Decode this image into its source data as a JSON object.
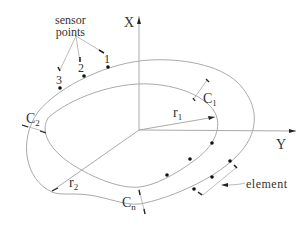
{
  "diagram": {
    "colors": {
      "line": "#aaaaaa",
      "ink": "#222222",
      "text": "#333333"
    },
    "axes": {
      "x_axis_label": "X",
      "y_axis_label": "Y"
    },
    "labels": {
      "sensor_points_line1": "sensor",
      "sensor_points_line2": "points",
      "point1": "1",
      "point2": "2",
      "point3": "3",
      "c1_main": "C",
      "c1_sub": "1",
      "c2_main": "C",
      "c2_sub": "2",
      "cn_main": "C",
      "cn_sub": "n",
      "r1_main": "r",
      "r1_sub": "1",
      "r2_main": "r",
      "r2_sub": "2",
      "element": "element"
    }
  }
}
